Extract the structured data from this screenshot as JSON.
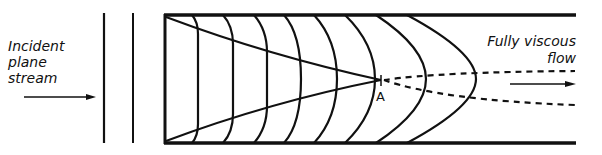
{
  "diagram": {
    "left_label": {
      "lines": [
        "Incident",
        "plane",
        "stream"
      ]
    },
    "right_label": {
      "lines": [
        "Fully viscous",
        "flow"
      ]
    },
    "point_label": "A",
    "colors": {
      "ink": "#111111",
      "background": "#ffffff"
    },
    "elements": {
      "incident_arrow": "right-arrow",
      "outflow_arrow": "right-arrow",
      "wavefront_lines": 2,
      "velocity_profiles": 8,
      "boundary_layer_edges": 2,
      "dashed_extensions": 2
    }
  }
}
